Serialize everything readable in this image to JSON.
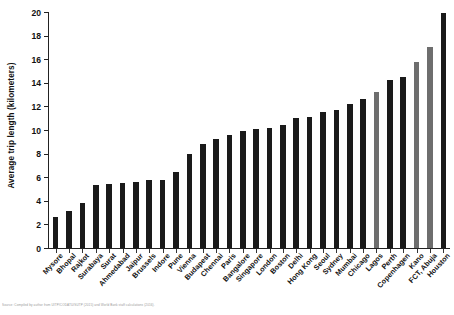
{
  "chart_data": {
    "type": "bar",
    "title": "",
    "subtitle": "",
    "xlabel": "",
    "ylabel": "Average trip length (kilometers)",
    "ylim": [
      0,
      20
    ],
    "ytick_step": 2,
    "ytick_labels": [
      "0",
      "2",
      "4",
      "6",
      "8",
      "10",
      "12",
      "14",
      "16",
      "18",
      "20"
    ],
    "grid": false,
    "legend_position": "none",
    "categories": [
      "Mysore",
      "Bhopal",
      "Rajkot",
      "Surabaya",
      "Surat",
      "Ahmedabad",
      "Jaipur",
      "Brussels",
      "Indore",
      "Pune",
      "Vienna",
      "Budapest",
      "Chennai",
      "Paris",
      "Bangalore",
      "Singapore",
      "London",
      "Boston",
      "Delhi",
      "Hong Kong",
      "Seoul",
      "Sydney",
      "Mumbai",
      "Chicago",
      "Lagos",
      "Perth",
      "Copenhagen",
      "Kano",
      "FCT, Abuja",
      "Houston"
    ],
    "values": [
      2.6,
      3.1,
      3.8,
      5.3,
      5.4,
      5.5,
      5.6,
      5.8,
      5.8,
      6.4,
      8.0,
      8.8,
      9.2,
      9.6,
      9.9,
      10.1,
      10.2,
      10.4,
      11.0,
      11.1,
      11.5,
      11.7,
      12.2,
      12.6,
      13.2,
      14.2,
      14.5,
      15.8,
      17.0,
      19.9
    ],
    "bar_colors": [
      "#1a1a1a",
      "#1a1a1a",
      "#1a1a1a",
      "#1a1a1a",
      "#1a1a1a",
      "#1a1a1a",
      "#1a1a1a",
      "#1a1a1a",
      "#1a1a1a",
      "#1a1a1a",
      "#1a1a1a",
      "#1a1a1a",
      "#1a1a1a",
      "#1a1a1a",
      "#1a1a1a",
      "#1a1a1a",
      "#1a1a1a",
      "#1a1a1a",
      "#1a1a1a",
      "#1a1a1a",
      "#1a1a1a",
      "#1a1a1a",
      "#1a1a1a",
      "#1a1a1a",
      "#6e6e6e",
      "#1a1a1a",
      "#1a1a1a",
      "#6e6e6e",
      "#6e6e6e",
      "#1a1a1a"
    ],
    "highlight_color": "#6e6e6e",
    "primary_color": "#1a1a1a",
    "highlighted_categories": [
      "Lagos",
      "Kano",
      "FCT, Abuja"
    ]
  },
  "caption": {
    "text": "Source: Compiled by author from UITP/CODATU/SUTP (2015) and World Bank staff calculations (2016)."
  }
}
